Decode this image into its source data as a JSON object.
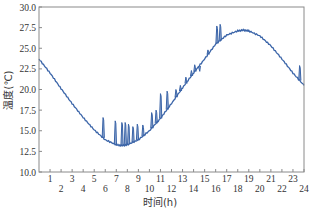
{
  "chart_data": {
    "type": "line",
    "title": "",
    "xlabel": "时间(h)",
    "ylabel": "温度(℃)",
    "xlim": [
      0,
      24
    ],
    "ylim": [
      10.0,
      30.0
    ],
    "grid": false,
    "legend": null,
    "x_ticks": [
      "1",
      "2",
      "3",
      "4",
      "5",
      "6",
      "7",
      "8",
      "9",
      "10",
      "11",
      "12",
      "13",
      "14",
      "15",
      "16",
      "17",
      "18",
      "19",
      "20",
      "21",
      "22",
      "23",
      "24"
    ],
    "y_ticks": [
      "10.0",
      "12.5",
      "15.0",
      "17.5",
      "20.0",
      "22.5",
      "25.0",
      "27.5",
      "30.0"
    ],
    "series": [
      {
        "name": "temperature",
        "color": "#3a64a8",
        "x": [
          0,
          1,
          2,
          3,
          4,
          5,
          6,
          7,
          7.5,
          8,
          9,
          10,
          11,
          12,
          13,
          14,
          15,
          16,
          17,
          18,
          18.5,
          19,
          20,
          21,
          22,
          23,
          24
        ],
        "values": [
          23.7,
          22.0,
          20.1,
          18.3,
          16.6,
          15.1,
          13.9,
          13.3,
          13.2,
          13.3,
          13.9,
          15.0,
          16.5,
          18.3,
          20.2,
          22.0,
          23.7,
          25.5,
          26.6,
          27.1,
          27.2,
          27.1,
          26.5,
          25.3,
          23.7,
          22.0,
          20.5
        ]
      }
    ],
    "spikes": [
      {
        "x": 5.8,
        "y": 16.6
      },
      {
        "x": 6.9,
        "y": 16.2
      },
      {
        "x": 7.5,
        "y": 16.0
      },
      {
        "x": 7.8,
        "y": 16.0
      },
      {
        "x": 8.1,
        "y": 15.8
      },
      {
        "x": 8.5,
        "y": 15.5
      },
      {
        "x": 8.9,
        "y": 15.8
      },
      {
        "x": 9.4,
        "y": 15.7
      },
      {
        "x": 10.2,
        "y": 17.2
      },
      {
        "x": 10.6,
        "y": 17.5
      },
      {
        "x": 11.0,
        "y": 19.5
      },
      {
        "x": 11.6,
        "y": 19.8
      },
      {
        "x": 12.4,
        "y": 20.0
      },
      {
        "x": 12.8,
        "y": 20.5
      },
      {
        "x": 13.3,
        "y": 21.5
      },
      {
        "x": 13.8,
        "y": 22.3
      },
      {
        "x": 14.1,
        "y": 23.0
      },
      {
        "x": 14.5,
        "y": 22.5
      },
      {
        "x": 15.3,
        "y": 24.8
      },
      {
        "x": 16.1,
        "y": 27.7
      },
      {
        "x": 16.4,
        "y": 27.9
      },
      {
        "x": 23.6,
        "y": 22.9
      }
    ]
  }
}
